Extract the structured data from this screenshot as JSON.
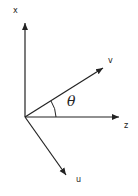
{
  "diagram": {
    "labels": {
      "x": "x",
      "v": "v",
      "z": "z",
      "u": "u",
      "angle": "θ"
    },
    "colors": {
      "line": "#222222",
      "background": "#ffffff"
    }
  }
}
